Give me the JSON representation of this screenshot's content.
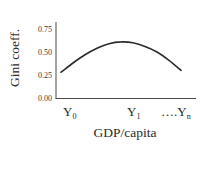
{
  "chart_data": {
    "type": "line",
    "title": "",
    "xlabel": "GDP/capita",
    "ylabel": "Gini coeff.",
    "ylim": [
      0,
      0.75
    ],
    "yticks": [
      "0.00",
      "0.25",
      "0.50",
      "0.75"
    ],
    "xticks": [
      {
        "label": "Y",
        "sub": "0"
      },
      {
        "label": "Y",
        "sub": "1"
      },
      {
        "label": "….Y",
        "sub": "n"
      }
    ],
    "grid": false,
    "legend": null,
    "series": [
      {
        "name": "Kuznets curve",
        "x": [
          0,
          0.1,
          0.2,
          0.3,
          0.4,
          0.5,
          0.6,
          0.7,
          0.8,
          0.9,
          1.0
        ],
        "values": [
          0.28,
          0.38,
          0.47,
          0.54,
          0.59,
          0.61,
          0.6,
          0.56,
          0.5,
          0.41,
          0.3
        ]
      }
    ],
    "line_color": "#2b2b2b"
  }
}
